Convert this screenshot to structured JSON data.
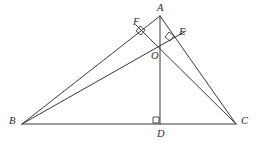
{
  "figure": {
    "width": 256,
    "height": 145,
    "background_color": "#ffffff",
    "stroke_color": "#3a3a3a",
    "label_color": "#2b2b2b",
    "stroke_width": 1
  },
  "points": [
    {
      "id": "A",
      "label": "A",
      "x": 160,
      "y": 16,
      "label_x": 157,
      "label_y": 3,
      "role": "apex-vertex"
    },
    {
      "id": "B",
      "label": "B",
      "x": 22,
      "y": 124,
      "label_x": 9,
      "label_y": 116,
      "role": "left-vertex"
    },
    {
      "id": "C",
      "label": "C",
      "x": 236,
      "y": 124,
      "label_x": 241,
      "label_y": 116,
      "role": "right-vertex"
    },
    {
      "id": "D",
      "label": "D",
      "x": 160,
      "y": 124,
      "label_x": 157,
      "label_y": 129,
      "role": "foot-of-altitude-from-A"
    },
    {
      "id": "E",
      "label": "E",
      "x": 175,
      "y": 38,
      "label_x": 179,
      "label_y": 27,
      "role": "foot-of-altitude-from-B"
    },
    {
      "id": "F",
      "label": "F",
      "x": 144,
      "y": 30,
      "label_x": 133,
      "label_y": 17,
      "role": "foot-of-altitude-from-C"
    },
    {
      "id": "O",
      "label": "O",
      "x": 160,
      "y": 48,
      "label_x": 151,
      "label_y": 51,
      "role": "orthocenter"
    }
  ],
  "segments": [
    {
      "id": "AB",
      "name": "side-ab",
      "from": "A",
      "to": "B",
      "d": "M 160 16 L 22 124"
    },
    {
      "id": "AC",
      "name": "side-ac",
      "from": "A",
      "to": "C",
      "d": "M 160 16 L 236 124"
    },
    {
      "id": "BC",
      "name": "side-bc",
      "from": "B",
      "to": "C",
      "d": "M 22 124 L 236 124"
    },
    {
      "id": "AD",
      "name": "altitude-ad",
      "from": "A",
      "to": "D",
      "d": "M 160 16 L 160 124"
    },
    {
      "id": "BE",
      "name": "altitude-be",
      "from": "B",
      "to": "E",
      "d": "M 22 124 L 186 31"
    },
    {
      "id": "CF",
      "name": "altitude-cf",
      "from": "C",
      "to": "F",
      "d": "M 236 124 L 136 25"
    }
  ],
  "right_angle_marks": [
    {
      "id": "mark-D",
      "name": "right-angle-mark-at-d",
      "d": "M 153 117 L 159 117 L 159 123 L 153 123 Z"
    },
    {
      "id": "mark-E",
      "name": "right-angle-mark-at-e",
      "d": "M 169 32 L 174 36 L 170 41 L 165 37 Z"
    },
    {
      "id": "mark-F",
      "name": "right-angle-mark-at-f",
      "d": "M 140 26 L 145 30 L 141 35 L 136 31 Z"
    }
  ],
  "notes": {
    "description": "Acute triangle ABC with altitudes AD, BE and CF concurrent at the orthocenter O. Right-angle squares mark perpendicularity at D, E and F."
  }
}
